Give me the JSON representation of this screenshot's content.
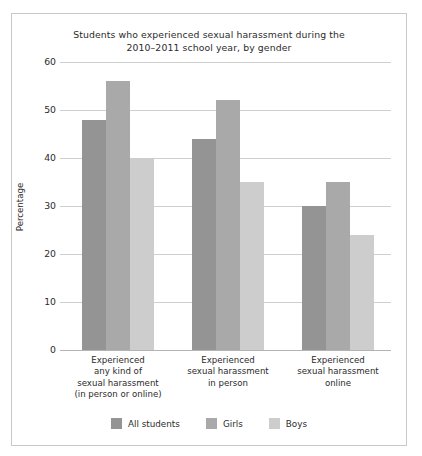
{
  "card": {
    "background": "#ffffff",
    "border_color": "#c9c9c9"
  },
  "chart_data": {
    "type": "bar",
    "title": "Students who experienced sexual harassment during the 2010–2011 school year, by gender",
    "title_lines": [
      "Students who experienced sexual harassment during the",
      "2010–2011 school year, by gender"
    ],
    "xlabel": "",
    "ylabel": "Percentage",
    "ylim": [
      0,
      60
    ],
    "ytick_values": [
      0,
      10,
      20,
      30,
      40,
      50,
      60
    ],
    "ytick_labels": [
      "0",
      "10",
      "20",
      "30",
      "40",
      "50",
      "60"
    ],
    "grid": true,
    "grid_color": "#cfcfcf",
    "legend_position": "bottom-center",
    "categories": [
      "Experienced any kind of sexual harassment (in person or online)",
      "Experienced sexual harassment in person",
      "Experienced sexual harassment online"
    ],
    "category_lines": [
      [
        "Experienced",
        "any kind of",
        "sexual harassment",
        "(in person or online)"
      ],
      [
        "Experienced",
        "sexual harassment",
        "in person"
      ],
      [
        "Experienced",
        "sexual harassment",
        "online"
      ]
    ],
    "series": [
      {
        "name": "All students",
        "color": "#949494",
        "values": [
          48,
          44,
          30
        ]
      },
      {
        "name": "Girls",
        "color": "#a9a9a9",
        "values": [
          56,
          52,
          35
        ]
      },
      {
        "name": "Boys",
        "color": "#cdcdcd",
        "values": [
          40,
          35,
          24
        ]
      }
    ]
  }
}
